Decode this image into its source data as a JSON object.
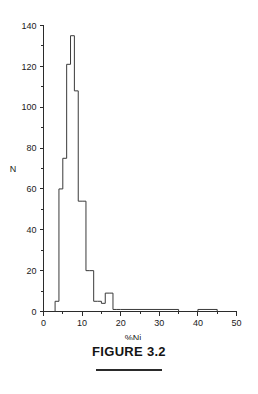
{
  "figure": {
    "caption": "FIGURE 3.2",
    "rule": "horizontal-rule"
  },
  "chart_data": {
    "type": "bar",
    "subtype": "histogram",
    "title": "",
    "xlabel": "%Ni",
    "ylabel": "N",
    "xlim": [
      0,
      50
    ],
    "ylim": [
      0,
      140
    ],
    "bin_width": 1,
    "grid": false,
    "legend": null,
    "x_ticks_major": [
      0,
      10,
      20,
      30,
      40,
      50
    ],
    "x_ticks_major_labels": [
      "0",
      "10",
      "20",
      "30",
      "40",
      "50"
    ],
    "x_ticks_minor": [
      5,
      15,
      25,
      35,
      45
    ],
    "y_ticks_major": [
      0,
      20,
      40,
      60,
      80,
      100,
      120,
      140
    ],
    "y_ticks_major_labels": [
      "0",
      "20",
      "40",
      "60",
      "80",
      "100",
      "120",
      "140"
    ],
    "y_ticks_minor": [
      10,
      30,
      50,
      70,
      90,
      110,
      130
    ],
    "bin_edges": [
      3,
      4,
      5,
      6,
      7,
      8,
      9,
      10,
      11,
      12,
      13,
      14,
      15,
      16,
      17,
      18,
      19,
      20,
      21,
      22,
      23,
      24,
      25,
      26,
      27,
      28,
      29,
      30,
      31,
      32,
      33,
      34,
      35,
      40,
      41,
      42,
      43,
      44,
      45
    ],
    "categories": [
      "3-4",
      "4-5",
      "5-6",
      "6-7",
      "7-8",
      "8-9",
      "9-10",
      "10-11",
      "11-12",
      "12-13",
      "13-14",
      "14-15",
      "15-16",
      "16-17",
      "17-18",
      "18-19",
      "19-20",
      "20-35",
      "40-45"
    ],
    "values": [
      5,
      60,
      75,
      121,
      135,
      108,
      54,
      54,
      20,
      20,
      5,
      5,
      4,
      9,
      9,
      1,
      1,
      1,
      1
    ],
    "series": [
      {
        "name": "%Ni frequency",
        "color": "#3a3a3a",
        "values": [
          5,
          60,
          75,
          121,
          135,
          108,
          54,
          54,
          20,
          20,
          5,
          5,
          4,
          9,
          9,
          1,
          1,
          1,
          1
        ]
      }
    ],
    "peak": {
      "bin": "7-8",
      "value": 135
    }
  }
}
